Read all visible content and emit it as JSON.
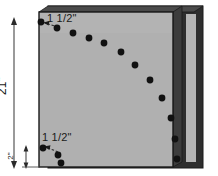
{
  "figure": {
    "background_color": "#ffffff"
  },
  "colors": {
    "panel_face": "#b0b0b0",
    "panel_face_light": "#bdbdbd",
    "panel_edge_dark": "#3c3c3c",
    "panel_edge_mid": "#585858",
    "back_panel": "#2e2e2e",
    "spine_light": "#b5b5b5",
    "dot": "#111111",
    "outline": "#1a1a1a",
    "dim_line": "#6f6f6f",
    "text": "#1a1a1a"
  },
  "labels": {
    "top_inset": "1 1/2\"",
    "bottom_inset": "1 1/2\"",
    "overall_height": "21\"",
    "bottom_offset": "2\""
  },
  "dimensions": {
    "overall_height_value": 21,
    "overall_height_unit": "in",
    "top_inset_value": 1.5,
    "bottom_inset_value": 1.5,
    "bottom_offset_value": 2
  },
  "panel": {
    "face": {
      "x": 39,
      "y": 12,
      "width": 134,
      "height": 155
    },
    "shadow_offset": {
      "x": 9,
      "y": 4
    },
    "spine": {
      "x": 186,
      "y": 14,
      "width": 10,
      "height": 148
    }
  },
  "dots": {
    "radius": 3.4,
    "curve_points": [
      {
        "id": 1,
        "x": 41,
        "y": 22
      },
      {
        "id": 2,
        "x": 57,
        "y": 28
      },
      {
        "id": 3,
        "x": 73,
        "y": 33
      },
      {
        "id": 4,
        "x": 89,
        "y": 38
      },
      {
        "id": 5,
        "x": 104,
        "y": 43
      },
      {
        "id": 6,
        "x": 121,
        "y": 52
      },
      {
        "id": 7,
        "x": 135,
        "y": 65
      },
      {
        "id": 8,
        "x": 150,
        "y": 80
      },
      {
        "id": 9,
        "x": 162,
        "y": 98
      },
      {
        "id": 10,
        "x": 171,
        "y": 118
      },
      {
        "id": 11,
        "x": 175,
        "y": 139
      },
      {
        "id": 12,
        "x": 177,
        "y": 159
      }
    ],
    "lower_points": [
      {
        "id": 13,
        "x": 43,
        "y": 148
      },
      {
        "id": 14,
        "x": 58,
        "y": 155
      },
      {
        "id": 15,
        "x": 61,
        "y": 163
      }
    ]
  },
  "leaders": {
    "top": {
      "x1": 56,
      "y1": 26,
      "x2": 45,
      "y2": 23
    },
    "bottom": {
      "x1": 56,
      "y1": 150,
      "x2": 45,
      "y2": 147
    }
  },
  "dimension_line": {
    "x": 14,
    "y_top": 20,
    "y_bottom": 166
  },
  "small_dimension_line": {
    "x": 14,
    "y_top": 148,
    "y_bottom": 166
  }
}
